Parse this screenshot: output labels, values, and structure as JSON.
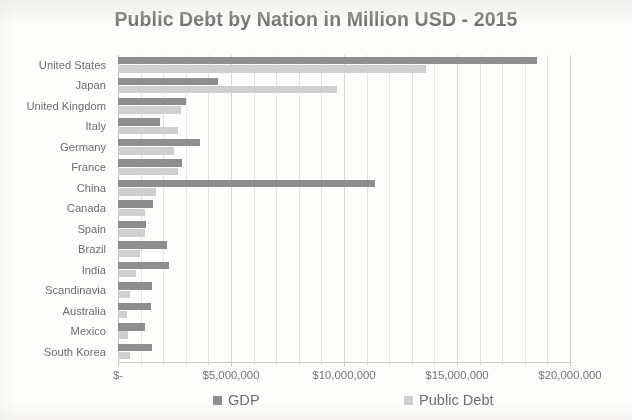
{
  "chart_data": {
    "type": "bar",
    "orientation": "horizontal",
    "title": "Public Debt by Nation in Million USD - 2015",
    "xlabel": "",
    "ylabel": "",
    "xlim": [
      0,
      20000000
    ],
    "grid": true,
    "legend_position": "bottom",
    "categories": [
      "United States",
      "Japan",
      "United Kingdom",
      "Italy",
      "Germany",
      "France",
      "China",
      "Canada",
      "Spain",
      "Brazil",
      "India",
      "Scandinavia",
      "Australia",
      "Mexico",
      "South Korea"
    ],
    "series": [
      {
        "name": "GDP",
        "color": "#8e8e8e",
        "values": [
          18560000,
          4410000,
          3030000,
          1850000,
          3640000,
          2840000,
          11380000,
          1550000,
          1250000,
          2180000,
          2270000,
          1510000,
          1460000,
          1180000,
          1520000
        ]
      },
      {
        "name": "Public Debt",
        "color": "#cfcfcf",
        "values": [
          13650000,
          9700000,
          2770000,
          2640000,
          2470000,
          2640000,
          1680000,
          1190000,
          1190000,
          960000,
          790000,
          510000,
          420000,
          430000,
          520000
        ]
      }
    ],
    "x_ticks": [
      {
        "value": 0,
        "label": "$-"
      },
      {
        "value": 5000000,
        "label": "$5,000,000"
      },
      {
        "value": 10000000,
        "label": "$10,000,000"
      },
      {
        "value": 15000000,
        "label": "$15,000,000"
      },
      {
        "value": 20000000,
        "label": "$20,000,000"
      }
    ],
    "minor_tick_interval": 1000000
  },
  "legend": {
    "gdp_label": "GDP",
    "debt_label": "Public Debt"
  }
}
